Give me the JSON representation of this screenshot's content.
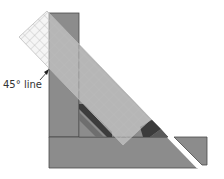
{
  "figure": {
    "label_45": "45° line",
    "colors": {
      "fabric": "#8c8c8c",
      "fabric_edge": "#4a4a4a",
      "fabric_dark": "#5a5a5a",
      "stripe_dark": "#3c3c3c",
      "stripe_mid": "#6e6e6e",
      "ruler_grid": "#c8c8c8",
      "ruler_fill": "#e8e8e8",
      "background": "#ffffff",
      "arrow": "#222222"
    }
  }
}
